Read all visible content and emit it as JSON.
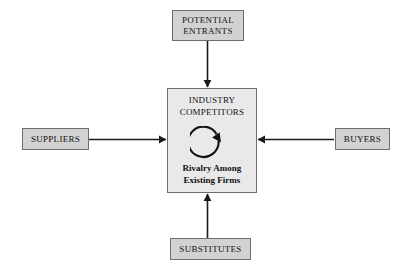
{
  "diagram": {
    "background_color": "#ffffff",
    "box_fill_color": "#d2d2d2",
    "center_box_fill_color": "#e9e9e9",
    "border_color": "#6e6e6e",
    "arrow_color": "#1a1a1a",
    "text_color": "#111111"
  },
  "center": {
    "title_line1": "INDUSTRY",
    "title_line2": "COMPETITORS",
    "subtitle_line1": "Rivalry Among",
    "subtitle_line2": "Existing Firms",
    "rivalry_icon": "circular-arrow-icon"
  },
  "forces": {
    "top": {
      "line1": "POTENTIAL",
      "line2": "ENTRANTS"
    },
    "left": {
      "line1": "SUPPLIERS"
    },
    "right": {
      "line1": "BUYERS"
    },
    "bottom": {
      "line1": "SUBSTITUTES"
    }
  },
  "arrows": [
    {
      "name": "arrow-potential-entrants-to-center",
      "direction": "down"
    },
    {
      "name": "arrow-suppliers-to-center",
      "direction": "right"
    },
    {
      "name": "arrow-buyers-to-center",
      "direction": "left"
    },
    {
      "name": "arrow-substitutes-to-center",
      "direction": "up"
    }
  ]
}
